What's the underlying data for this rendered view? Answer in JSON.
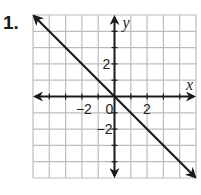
{
  "problem": {
    "number": "1."
  },
  "chart_data": {
    "type": "line",
    "title": "",
    "xlabel": "x",
    "ylabel": "y",
    "xlim": [
      -5,
      5
    ],
    "ylim": [
      -5,
      5
    ],
    "grid": true,
    "grid_step": 1,
    "x_tick_labels": [
      {
        "value": -2,
        "label": "−2"
      },
      {
        "value": 0,
        "label": "0"
      },
      {
        "value": 2,
        "label": "2"
      }
    ],
    "y_tick_labels": [
      {
        "value": 2,
        "label": "2"
      },
      {
        "value": -2,
        "label": "−2"
      }
    ],
    "series": [
      {
        "name": "line",
        "equation": "y = -x",
        "x": [
          -5,
          5
        ],
        "y": [
          5,
          -5
        ],
        "arrows": "both"
      }
    ],
    "colors": {
      "grid": "#bdbdbd",
      "axes": "#1a1a1a",
      "line": "#1a1a1a"
    }
  }
}
